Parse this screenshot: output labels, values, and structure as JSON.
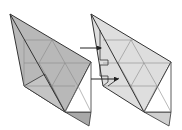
{
  "diagram": {
    "colors": {
      "left_fill": "#b9b9b9",
      "right_fill": "#dcdcdc",
      "edge": "#333333",
      "grid": "#8a8a8a",
      "arrow": "#222222",
      "background": "#ffffff"
    },
    "figures": [
      {
        "name": "left-figure",
        "shade": "dark"
      },
      {
        "name": "right-figure",
        "shade": "light"
      }
    ],
    "arrows": [
      {
        "name": "arrow-upper"
      },
      {
        "name": "arrow-lower"
      }
    ]
  }
}
